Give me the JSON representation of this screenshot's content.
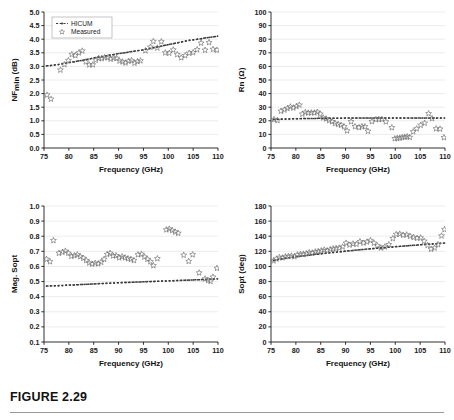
{
  "figure": {
    "caption": "FIGURE 2.29",
    "legend": {
      "hicum_label": "HICUM",
      "measured_label": "Measured"
    },
    "colors": {
      "axis": "#1a1a1a",
      "grid": "#d9d9d9",
      "marker": "#6e6e6e",
      "model": "#3a3a3a"
    }
  },
  "chart_data": [
    {
      "id": "nfmin",
      "position": "top-left",
      "type": "scatter",
      "title": "",
      "xlabel": "Frequency (GHz)",
      "ylabel": "NFmin (dB)",
      "ylabel_main": "NF",
      "ylabel_sub": "min",
      "ylabel_unit": " (dB)",
      "xlim": [
        75,
        110
      ],
      "ylim": [
        0.0,
        5.0
      ],
      "xticks": [
        75,
        80,
        85,
        90,
        95,
        100,
        105,
        110
      ],
      "yticks": [
        0.0,
        0.5,
        1.0,
        1.5,
        2.0,
        2.5,
        3.0,
        3.5,
        4.0,
        4.5,
        5.0
      ],
      "ytick_labels": [
        "0.0",
        "0.5",
        "1.0",
        "1.5",
        "2.0",
        "2.5",
        "3.0",
        "3.5",
        "4.0",
        "4.5",
        "5.0"
      ],
      "grid": true,
      "legend_position": "top-left",
      "series": [
        {
          "name": "HICUM",
          "style": "dashed-line-with-dots",
          "x": [
            75.5,
            76.3,
            77.1,
            77.9,
            78.7,
            79.5,
            80.3,
            81.1,
            81.9,
            82.7,
            83.5,
            84.3,
            85.1,
            85.9,
            86.7,
            87.5,
            88.3,
            89.1,
            89.9,
            90.7,
            91.5,
            92.3,
            93.1,
            93.9,
            94.7,
            95.5,
            96.3,
            97.1,
            97.9,
            98.7,
            99.5,
            100.3,
            101.1,
            101.9,
            102.7,
            103.5,
            104.3,
            105.1,
            105.9,
            106.7,
            107.5,
            108.3,
            109.1,
            109.9
          ],
          "y": [
            3.02,
            3.03,
            3.05,
            3.07,
            3.1,
            3.12,
            3.15,
            3.17,
            3.2,
            3.22,
            3.25,
            3.28,
            3.31,
            3.34,
            3.36,
            3.39,
            3.42,
            3.44,
            3.47,
            3.49,
            3.51,
            3.54,
            3.56,
            3.58,
            3.6,
            3.63,
            3.66,
            3.69,
            3.72,
            3.75,
            3.78,
            3.81,
            3.84,
            3.87,
            3.9,
            3.93,
            3.96,
            3.98,
            4.0,
            4.02,
            4.05,
            4.07,
            4.09,
            4.11
          ]
        },
        {
          "name": "Measured",
          "style": "star-markers",
          "x": [
            75.6,
            76.4,
            78.3,
            79.1,
            79.9,
            80.6,
            81.3,
            82.0,
            82.7,
            83.4,
            84.1,
            84.8,
            85.4,
            86.0,
            86.6,
            87.2,
            87.8,
            88.4,
            89.0,
            89.6,
            90.2,
            90.8,
            91.4,
            92.0,
            92.6,
            93.2,
            93.8,
            94.4,
            95.4,
            96.4,
            97.0,
            97.8,
            98.6,
            99.4,
            100.2,
            101.0,
            101.8,
            102.6,
            103.4,
            104.2,
            105.0,
            105.8,
            106.6,
            107.4,
            108.2,
            109.0,
            109.8
          ],
          "y": [
            1.95,
            1.8,
            2.87,
            3.07,
            3.22,
            3.44,
            3.4,
            3.5,
            3.57,
            3.17,
            3.06,
            3.06,
            3.23,
            3.3,
            3.29,
            3.33,
            3.32,
            3.27,
            3.31,
            3.3,
            3.2,
            3.17,
            3.13,
            3.19,
            3.22,
            3.12,
            3.18,
            3.21,
            3.58,
            3.71,
            3.92,
            3.68,
            3.91,
            3.5,
            3.49,
            3.61,
            3.44,
            3.32,
            3.4,
            3.49,
            3.51,
            3.62,
            3.86,
            3.6,
            3.88,
            3.63,
            3.6
          ]
        }
      ]
    },
    {
      "id": "rn",
      "position": "top-right",
      "type": "scatter",
      "title": "",
      "xlabel": "Frequency (GHz)",
      "ylabel": "Rn (Ω)",
      "xlim": [
        75,
        110
      ],
      "ylim": [
        0,
        100
      ],
      "xticks": [
        75,
        80,
        85,
        90,
        95,
        100,
        105,
        110
      ],
      "yticks": [
        0,
        10,
        20,
        30,
        40,
        50,
        60,
        70,
        80,
        90,
        100
      ],
      "ytick_labels": [
        "0",
        "10",
        "20",
        "30",
        "40",
        "50",
        "60",
        "70",
        "80",
        "90",
        "100"
      ],
      "grid": true,
      "legend_position": "none",
      "series": [
        {
          "name": "HICUM",
          "style": "dashed-line-with-dots",
          "x": [
            75.5,
            76.3,
            77.1,
            77.9,
            78.7,
            79.5,
            80.3,
            81.1,
            81.9,
            82.7,
            83.5,
            84.3,
            85.1,
            85.9,
            86.7,
            87.5,
            88.3,
            89.1,
            89.9,
            90.7,
            91.5,
            92.3,
            93.1,
            93.9,
            94.7,
            95.5,
            96.3,
            97.1,
            97.9,
            98.7,
            99.5,
            100.3,
            101.1,
            101.9,
            102.7,
            103.5,
            104.3,
            105.1,
            105.9,
            106.7,
            107.5,
            108.3,
            109.1,
            109.9
          ],
          "y": [
            21.0,
            21.1,
            21.2,
            21.3,
            21.4,
            21.5,
            21.5,
            21.6,
            21.6,
            21.7,
            21.7,
            21.8,
            21.8,
            21.8,
            21.9,
            21.9,
            21.9,
            21.9,
            22.0,
            22.0,
            22.0,
            22.0,
            22.0,
            22.0,
            22.0,
            22.0,
            22.0,
            22.0,
            22.0,
            22.0,
            22.0,
            22.0,
            22.0,
            22.0,
            22.0,
            22.0,
            22.0,
            22.0,
            22.0,
            22.0,
            22.0,
            22.0,
            22.0,
            22.0
          ]
        },
        {
          "name": "Measured",
          "style": "star-markers",
          "x": [
            75.6,
            76.3,
            77.0,
            77.7,
            78.3,
            78.9,
            79.5,
            80.1,
            80.7,
            81.3,
            81.9,
            82.5,
            83.1,
            83.7,
            84.3,
            84.9,
            85.5,
            86.1,
            86.7,
            87.3,
            87.9,
            88.5,
            89.1,
            89.7,
            90.3,
            91.1,
            91.9,
            92.7,
            93.3,
            93.9,
            94.5,
            95.3,
            96.1,
            96.7,
            97.3,
            98.1,
            99.3,
            99.9,
            100.4,
            100.9,
            101.4,
            101.9,
            102.4,
            102.9,
            103.6,
            104.3,
            105.1,
            105.9,
            106.7,
            107.4,
            108.2,
            109.0,
            109.8
          ],
          "y": [
            21.0,
            20.3,
            27.1,
            28.0,
            29.1,
            30.3,
            29.5,
            30.6,
            31.6,
            25.0,
            26.2,
            25.8,
            26.0,
            25.9,
            26.4,
            25.0,
            22.2,
            21.5,
            20.2,
            19.4,
            18.1,
            17.4,
            16.8,
            15.7,
            12.7,
            19.4,
            15.8,
            15.1,
            15.9,
            15.7,
            12.4,
            19.5,
            21.0,
            21.1,
            21.2,
            19.3,
            15.0,
            6.9,
            7.2,
            7.4,
            7.8,
            8.1,
            8.4,
            7.9,
            12.0,
            14.2,
            16.8,
            18.3,
            25.3,
            21.7,
            14.2,
            14.0,
            7.7
          ]
        }
      ]
    },
    {
      "id": "mag-sopt",
      "position": "bottom-left",
      "type": "scatter",
      "title": "",
      "xlabel": "Frequency (GHz)",
      "ylabel": "Mag. Sopt",
      "xlim": [
        75,
        110
      ],
      "ylim": [
        0.1,
        1.0
      ],
      "xticks": [
        75,
        80,
        85,
        90,
        95,
        100,
        105,
        110
      ],
      "yticks": [
        0.1,
        0.2,
        0.3,
        0.4,
        0.5,
        0.6,
        0.7,
        0.8,
        0.9,
        1.0
      ],
      "ytick_labels": [
        "0.1",
        "0.2",
        "0.3",
        "0.4",
        "0.5",
        "0.6",
        "0.7",
        "0.8",
        "0.9",
        "1.0"
      ],
      "grid": true,
      "legend_position": "none",
      "series": [
        {
          "name": "HICUM",
          "style": "dashed-line-with-dots",
          "x": [
            75.5,
            76.3,
            77.1,
            77.9,
            78.7,
            79.5,
            80.3,
            81.1,
            81.9,
            82.7,
            83.5,
            84.3,
            85.1,
            85.9,
            86.7,
            87.5,
            88.3,
            89.1,
            89.9,
            90.7,
            91.5,
            92.3,
            93.1,
            93.9,
            94.7,
            95.5,
            96.3,
            97.1,
            97.9,
            98.7,
            99.5,
            100.3,
            101.1,
            101.9,
            102.7,
            103.5,
            104.3,
            105.1,
            105.9,
            106.7,
            107.5,
            108.3,
            109.1,
            109.9
          ],
          "y": [
            0.47,
            0.471,
            0.472,
            0.473,
            0.474,
            0.476,
            0.477,
            0.478,
            0.479,
            0.481,
            0.482,
            0.483,
            0.484,
            0.486,
            0.487,
            0.488,
            0.489,
            0.491,
            0.492,
            0.493,
            0.494,
            0.495,
            0.496,
            0.497,
            0.498,
            0.499,
            0.5,
            0.501,
            0.502,
            0.503,
            0.504,
            0.505,
            0.506,
            0.507,
            0.508,
            0.509,
            0.51,
            0.511,
            0.512,
            0.513,
            0.514,
            0.515,
            0.516,
            0.518
          ]
        },
        {
          "name": "Measured",
          "style": "star-markers",
          "x": [
            75.5,
            76.2,
            76.9,
            78.0,
            78.7,
            79.3,
            79.9,
            80.5,
            81.1,
            81.7,
            82.3,
            82.9,
            83.5,
            84.1,
            84.7,
            85.3,
            85.9,
            86.5,
            87.1,
            87.7,
            88.3,
            88.9,
            89.5,
            90.1,
            90.7,
            91.3,
            91.9,
            92.5,
            93.1,
            93.9,
            94.6,
            95.2,
            95.8,
            96.4,
            97.0,
            97.8,
            99.6,
            100.2,
            100.8,
            101.4,
            102.0,
            103.1,
            104.1,
            104.9,
            106.2,
            107.4,
            108.0,
            108.5,
            109.0,
            109.8
          ],
          "y": [
            0.648,
            0.632,
            0.772,
            0.688,
            0.694,
            0.702,
            0.688,
            0.668,
            0.672,
            0.678,
            0.665,
            0.655,
            0.64,
            0.623,
            0.616,
            0.622,
            0.618,
            0.628,
            0.648,
            0.68,
            0.688,
            0.67,
            0.672,
            0.658,
            0.665,
            0.658,
            0.652,
            0.648,
            0.64,
            0.678,
            0.682,
            0.663,
            0.648,
            0.632,
            0.606,
            0.652,
            0.843,
            0.848,
            0.838,
            0.828,
            0.82,
            0.675,
            0.634,
            0.678,
            0.558,
            0.518,
            0.508,
            0.502,
            0.53,
            0.588
          ]
        }
      ]
    },
    {
      "id": "sopt",
      "position": "bottom-right",
      "type": "scatter",
      "title": "",
      "xlabel": "Frequency (GHz)",
      "ylabel": "Sopt (deg)",
      "xlim": [
        75,
        110
      ],
      "ylim": [
        0,
        180
      ],
      "xticks": [
        75,
        80,
        85,
        90,
        95,
        100,
        105,
        110
      ],
      "yticks": [
        0,
        20,
        40,
        60,
        80,
        100,
        120,
        140,
        160,
        180
      ],
      "ytick_labels": [
        "0",
        "20",
        "40",
        "60",
        "80",
        "100",
        "120",
        "140",
        "160",
        "180"
      ],
      "grid": true,
      "legend_position": "none",
      "series": [
        {
          "name": "HICUM",
          "style": "dashed-line-with-dots",
          "x": [
            75.5,
            76.3,
            77.1,
            77.9,
            78.7,
            79.5,
            80.3,
            81.1,
            81.9,
            82.7,
            83.5,
            84.3,
            85.1,
            85.9,
            86.7,
            87.5,
            88.3,
            89.1,
            89.9,
            90.7,
            91.5,
            92.3,
            93.1,
            93.9,
            94.7,
            95.5,
            96.3,
            97.1,
            97.9,
            98.7,
            99.5,
            100.3,
            101.1,
            101.9,
            102.7,
            103.5,
            104.3,
            105.1,
            105.9,
            106.7,
            107.5,
            108.3,
            109.1,
            109.9
          ],
          "y": [
            108.0,
            109.0,
            110.0,
            110.8,
            111.6,
            112.3,
            113.0,
            113.7,
            114.3,
            115.0,
            115.6,
            116.2,
            116.8,
            117.4,
            118.0,
            118.5,
            119.1,
            119.6,
            120.2,
            120.7,
            121.2,
            121.7,
            122.2,
            122.7,
            123.2,
            123.6,
            124.1,
            124.5,
            125.0,
            125.4,
            125.8,
            126.3,
            126.7,
            127.1,
            127.5,
            127.9,
            128.3,
            128.7,
            129.1,
            129.5,
            129.8,
            130.2,
            130.6,
            131.0
          ]
        },
        {
          "name": "Measured",
          "style": "star-markers",
          "x": [
            75.5,
            76.1,
            76.7,
            77.3,
            77.9,
            78.5,
            79.1,
            79.7,
            80.3,
            80.9,
            81.5,
            82.1,
            82.7,
            83.3,
            83.9,
            84.5,
            85.1,
            85.7,
            86.3,
            86.9,
            87.5,
            88.1,
            88.7,
            89.4,
            90.1,
            90.8,
            91.5,
            92.2,
            92.9,
            93.6,
            94.3,
            95.0,
            95.7,
            96.4,
            97.1,
            97.9,
            98.7,
            99.5,
            100.2,
            100.9,
            101.6,
            102.3,
            103.0,
            103.7,
            104.4,
            105.1,
            105.8,
            106.5,
            107.2,
            107.9,
            108.6,
            109.3,
            109.9
          ],
          "y": [
            107.5,
            110.0,
            112.0,
            111.5,
            113.0,
            113.5,
            114.0,
            113.0,
            115.5,
            116.0,
            116.5,
            117.0,
            118.5,
            118.0,
            119.5,
            120.0,
            121.0,
            122.0,
            121.0,
            122.5,
            123.5,
            124.0,
            124.5,
            126.0,
            131.0,
            128.5,
            130.0,
            129.5,
            133.0,
            131.0,
            132.5,
            134.5,
            131.0,
            127.5,
            124.5,
            126.0,
            129.0,
            137.0,
            142.5,
            143.0,
            141.5,
            142.0,
            140.0,
            138.5,
            137.5,
            138.0,
            133.5,
            128.0,
            123.0,
            124.5,
            129.0,
            140.5,
            149.0
          ]
        }
      ]
    }
  ]
}
